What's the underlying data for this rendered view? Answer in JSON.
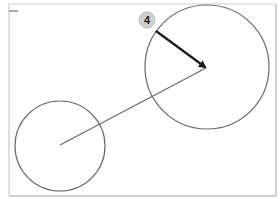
{
  "diagram": {
    "callout": {
      "label": "4",
      "badge_fill": "#d0d0d0",
      "text_color": "#222222"
    },
    "colors": {
      "frame": "#c8c8c8",
      "circle_stroke": "#6a6a6a",
      "connector": "#6a6a6a",
      "arrow": "#1a1a1a"
    },
    "elements": [
      {
        "type": "circle",
        "role": "small-circle"
      },
      {
        "type": "circle",
        "role": "large-circle"
      },
      {
        "type": "line",
        "role": "connector-line",
        "from": "small-circle-center",
        "to": "large-circle-center"
      },
      {
        "type": "arrow",
        "role": "callout-arrow",
        "points_to": "large-circle-center"
      }
    ]
  }
}
